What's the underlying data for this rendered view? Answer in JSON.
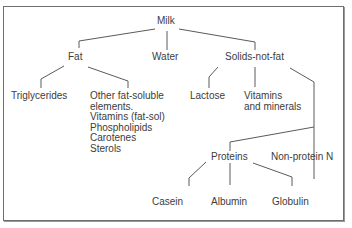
{
  "diagram": {
    "type": "tree",
    "root": "milk",
    "nodes": {
      "milk": {
        "label": "Milk"
      },
      "fat": {
        "label": "Fat"
      },
      "water": {
        "label": "Water"
      },
      "snf": {
        "label": "Solids-not-fat"
      },
      "triglycerides": {
        "label": "Triglycerides"
      },
      "other_fat_soluble": {
        "lines": [
          "Other fat-soluble",
          "elements.",
          "Vitamins (fat-sol)",
          "Phospholipids",
          "Carotenes",
          "Sterols"
        ]
      },
      "lactose": {
        "label": "Lactose"
      },
      "vitamins_minerals": {
        "lines": [
          "Vitamins",
          "and minerals"
        ]
      },
      "proteins": {
        "label": "Proteins"
      },
      "non_protein_n": {
        "label": "Non-protein N"
      },
      "casein": {
        "label": "Casein"
      },
      "albumin": {
        "label": "Albumin"
      },
      "globulin": {
        "label": "Globulin"
      }
    },
    "edges": [
      [
        "milk",
        "fat"
      ],
      [
        "milk",
        "water"
      ],
      [
        "milk",
        "snf"
      ],
      [
        "fat",
        "triglycerides"
      ],
      [
        "fat",
        "other_fat_soluble"
      ],
      [
        "snf",
        "lactose"
      ],
      [
        "snf",
        "vitamins_minerals"
      ],
      [
        "snf",
        "proteins"
      ],
      [
        "snf",
        "non_protein_n"
      ],
      [
        "proteins",
        "casein"
      ],
      [
        "proteins",
        "albumin"
      ],
      [
        "proteins",
        "globulin"
      ]
    ]
  }
}
